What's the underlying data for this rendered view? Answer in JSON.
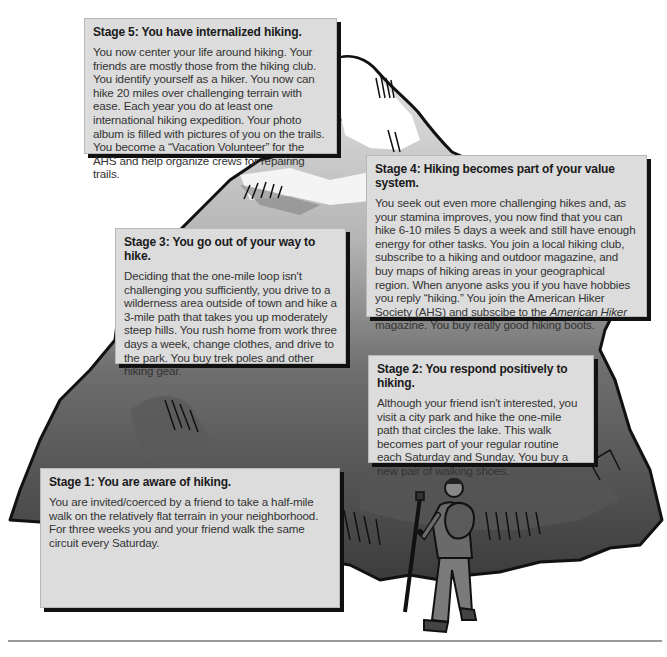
{
  "diagram": {
    "type": "mountain-stages",
    "colors": {
      "box_background": "#dcdcdc",
      "box_shadow": "#111111",
      "mountain_dark": "#4a4a4a",
      "mountain_mid": "#7a7a7a",
      "mountain_light": "#c4c4c4",
      "snow": "#ffffff"
    }
  },
  "stages": [
    {
      "title": "Stage 1: You are aware of hiking.",
      "body": "You are invited/coerced by a friend to take a half-mile walk on the relatively flat terrain in your neighborhood. For three weeks you and your friend walk the same circuit every Saturday."
    },
    {
      "title": "Stage 2: You respond positively to hiking.",
      "body": "Although your friend isn't interested, you visit a city park and hike the one-mile path that circles the lake. This walk becomes part of your regular routine each Saturday and Sunday. You buy a new pair of walking shoes."
    },
    {
      "title": "Stage 3: You go out of your way to hike.",
      "body": "Deciding that the one-mile loop isn't challenging you sufficiently, you drive to a wilderness area outside of town and hike a 3-mile path that takes you up moderately steep hills. You rush home from work three days a week, change clothes, and drive to the park. You buy trek poles and other hiking gear."
    },
    {
      "title": "Stage 4: Hiking becomes part of your value system.",
      "body_before_italic": "You seek out even more challenging hikes and, as your stamina improves, you now find that you can hike 6-10 miles 5 days a week and still have enough energy for other tasks. You join a local hiking club, subscribe to a hiking and outdoor magazine, and buy maps of hiking areas in your geographical region. When anyone asks you if you have hobbies you reply “hiking.” You join the American Hiker Society (AHS) and subscibe to the ",
      "body_italic": "American Hiker",
      "body_after_italic": " magazine. You buy really good hiking boots."
    },
    {
      "title": "Stage 5: You have internalized hiking.",
      "body": "You now center your life around hiking. Your friends are mostly those from the hiking club. You identify yourself as a hiker. You now can hike 20 miles over challenging terrain with ease. Each year you do at least one international hiking expedition. Your photo album is filled with pictures of you on the trails. You become a “Vacation Volunteer” for the AHS and help organize crews for repairing trails."
    }
  ],
  "figures": {
    "hiker": "hiker-with-backpack-and-trekking-pole",
    "mountain": "mountain-illustration"
  }
}
